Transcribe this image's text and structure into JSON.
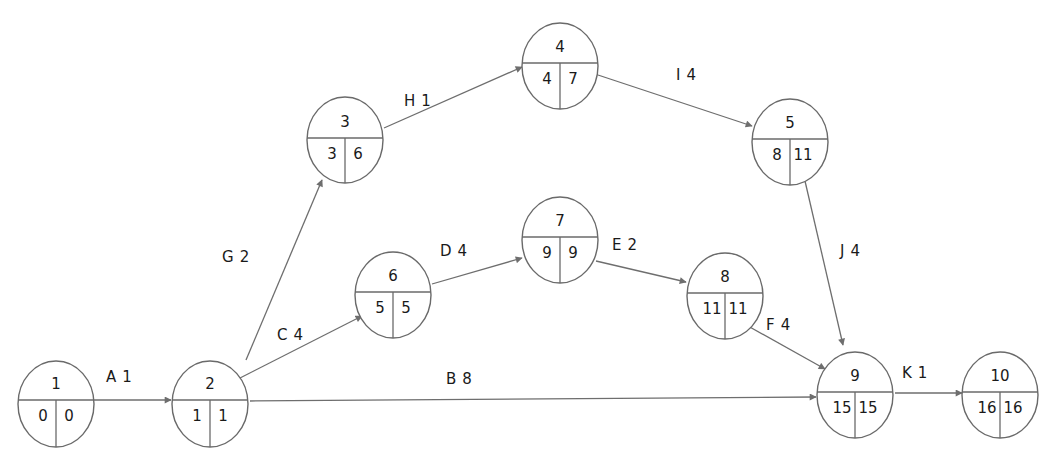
{
  "diagram": {
    "type": "activity-on-arrow network (CPM)",
    "colors": {
      "line": "#6e6e6e",
      "text": "#1a1a1a",
      "background": "#ffffff"
    },
    "nodes": [
      {
        "id": "1",
        "earliest": "0",
        "latest": "0",
        "cx": 56,
        "cy": 404,
        "divider": 400
      },
      {
        "id": "2",
        "earliest": "1",
        "latest": "1",
        "cx": 210,
        "cy": 404,
        "divider": 400
      },
      {
        "id": "3",
        "earliest": "3",
        "latest": "6",
        "cx": 345,
        "cy": 140,
        "divider": 138
      },
      {
        "id": "4",
        "earliest": "4",
        "latest": "7",
        "cx": 560,
        "cy": 66,
        "divider": 63
      },
      {
        "id": "5",
        "earliest": "8",
        "latest": "11",
        "cx": 790,
        "cy": 142,
        "divider": 139
      },
      {
        "id": "6",
        "earliest": "5",
        "latest": "5",
        "cx": 393,
        "cy": 295,
        "divider": 292
      },
      {
        "id": "7",
        "earliest": "9",
        "latest": "9",
        "cx": 560,
        "cy": 240,
        "divider": 237
      },
      {
        "id": "8",
        "earliest": "11",
        "latest": "11",
        "cx": 725,
        "cy": 296,
        "divider": 293
      },
      {
        "id": "9",
        "earliest": "15",
        "latest": "15",
        "cx": 855,
        "cy": 395,
        "divider": 392
      },
      {
        "id": "10",
        "earliest": "16",
        "latest": "16",
        "cx": 1000,
        "cy": 395,
        "divider": 392
      }
    ],
    "activities": [
      {
        "name": "A",
        "duration": "1",
        "from": "1",
        "to": "2",
        "x1": 94,
        "y1": 400,
        "x2": 171,
        "y2": 400,
        "lx": 106,
        "ly": 382
      },
      {
        "name": "B",
        "duration": "8",
        "from": "2",
        "to": "9",
        "x1": 250,
        "y1": 401,
        "x2": 816,
        "y2": 397,
        "lx": 446,
        "ly": 384
      },
      {
        "name": "C",
        "duration": "4",
        "from": "2",
        "to": "6",
        "x1": 240,
        "y1": 378,
        "x2": 362,
        "y2": 316,
        "lx": 277,
        "ly": 340
      },
      {
        "name": "D",
        "duration": "4",
        "from": "6",
        "to": "7",
        "x1": 432,
        "y1": 284,
        "x2": 522,
        "y2": 258,
        "lx": 440,
        "ly": 256
      },
      {
        "name": "E",
        "duration": "2",
        "from": "7",
        "to": "8",
        "x1": 596,
        "y1": 261,
        "x2": 686,
        "y2": 282,
        "lx": 612,
        "ly": 250
      },
      {
        "name": "F",
        "duration": "4",
        "from": "8",
        "to": "9",
        "x1": 748,
        "y1": 326,
        "x2": 825,
        "y2": 369,
        "lx": 766,
        "ly": 330
      },
      {
        "name": "G",
        "duration": "2",
        "from": "2",
        "to": "3",
        "x1": 246,
        "y1": 360,
        "x2": 322,
        "y2": 180,
        "lx": 222,
        "ly": 262
      },
      {
        "name": "H",
        "duration": "1",
        "from": "3",
        "to": "4",
        "x1": 384,
        "y1": 128,
        "x2": 522,
        "y2": 67,
        "lx": 404,
        "ly": 106
      },
      {
        "name": "I",
        "duration": "4",
        "from": "4",
        "to": "5",
        "x1": 598,
        "y1": 75,
        "x2": 752,
        "y2": 126,
        "lx": 676,
        "ly": 80
      },
      {
        "name": "J",
        "duration": "4",
        "from": "5",
        "to": "9",
        "x1": 805,
        "y1": 181,
        "x2": 843,
        "y2": 345,
        "lx": 840,
        "ly": 256
      },
      {
        "name": "K",
        "duration": "1",
        "from": "9",
        "to": "10",
        "x1": 895,
        "y1": 393,
        "x2": 962,
        "y2": 393,
        "lx": 902,
        "ly": 378
      }
    ]
  }
}
